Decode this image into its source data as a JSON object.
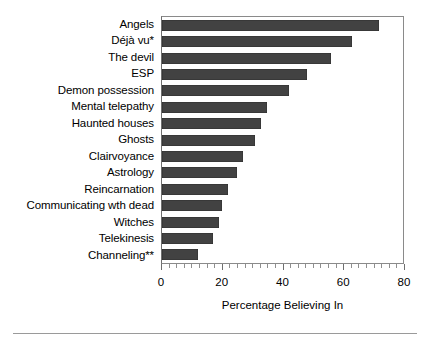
{
  "chart_data": {
    "type": "bar",
    "orientation": "horizontal",
    "title": "",
    "xlabel": "Percentage Believing In",
    "ylabel": "",
    "xlim": [
      0,
      80
    ],
    "xticks": [
      0,
      20,
      40,
      60,
      80
    ],
    "xtick_labels": [
      "0",
      "20",
      "40",
      "60",
      "80"
    ],
    "minor_ticks": true,
    "grid": false,
    "legend": null,
    "bar_color": "#424242",
    "frame_color": "#8a8a8a",
    "categories": [
      "Angels",
      "Déjà vu*",
      "The devil",
      "ESP",
      "Demon possession",
      "Mental telepathy",
      "Haunted houses",
      "Ghosts",
      "Clairvoyance",
      "Astrology",
      "Reincarnation",
      "Communicating wth dead",
      "Witches",
      "Telekinesis",
      "Channeling**"
    ],
    "values": [
      72,
      63,
      56,
      48,
      42,
      35,
      33,
      31,
      27,
      25,
      22,
      20,
      19,
      17,
      12
    ],
    "footnotes": [
      "*",
      "**"
    ]
  },
  "axis": {
    "title": "Percentage Believing In",
    "tick_labels": [
      "0",
      "20",
      "40",
      "60",
      "80"
    ]
  }
}
